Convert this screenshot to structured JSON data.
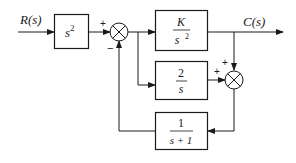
{
  "diagram": {
    "type": "block-diagram",
    "signals": {
      "input": "R(s)",
      "output": "C(s)"
    },
    "blocks": [
      {
        "id": "prefilter",
        "expr": "s",
        "exponent": "2"
      },
      {
        "id": "forward",
        "numerator": "K",
        "denominator": "s",
        "den_exponent": "2"
      },
      {
        "id": "parallel",
        "numerator": "2",
        "denominator": "s"
      },
      {
        "id": "feedback",
        "numerator": "1",
        "denominator": "s + 1"
      }
    ],
    "summing_junctions": [
      {
        "id": "sum1",
        "signs": {
          "top_left": "+",
          "bottom": "−"
        }
      },
      {
        "id": "sum2",
        "signs": {
          "top": "+",
          "left": "+"
        }
      }
    ],
    "colors": {
      "stroke": "#1a1a1a",
      "background": "#ffffff"
    }
  }
}
